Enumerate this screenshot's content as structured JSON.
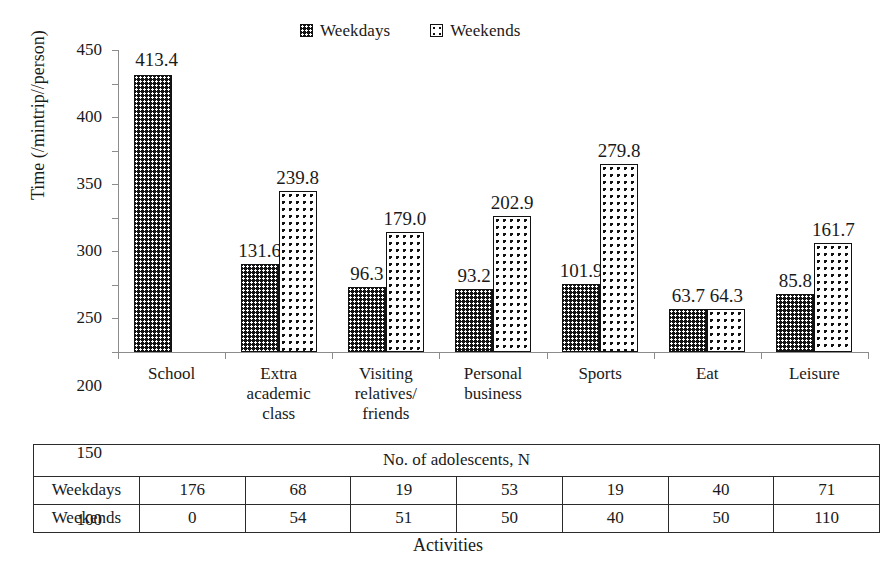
{
  "chart_data": {
    "type": "bar",
    "title": "",
    "xlabel": "Activities",
    "ylabel": "Time (/mintrip//person)",
    "ylim": [
      0,
      450
    ],
    "ytick_step": 50,
    "yticks": [
      450,
      400,
      350,
      300,
      250,
      200,
      150,
      100,
      50,
      0
    ],
    "grid": false,
    "legend_position": "top-center",
    "categories": [
      "School",
      "Extra academic class",
      "Visiting relatives/ friends",
      "Personal business",
      "Sports",
      "Eat",
      "Leisure"
    ],
    "category_lines": [
      [
        "School"
      ],
      [
        "Extra",
        "academic",
        "class"
      ],
      [
        "Visiting",
        "relatives/",
        "friends"
      ],
      [
        "Personal",
        "business"
      ],
      [
        "Sports"
      ],
      [
        "Eat"
      ],
      [
        "Leisure"
      ]
    ],
    "series": [
      {
        "name": "Weekdays",
        "values": [
          413.4,
          131.6,
          96.3,
          93.2,
          101.9,
          63.7,
          85.8
        ],
        "labels": [
          "413.4",
          "131.6",
          "96.3",
          "93.2",
          "101.9",
          "63.7",
          "85.8"
        ],
        "fill": "black-with-white-dots"
      },
      {
        "name": "Weekends",
        "values": [
          null,
          239.8,
          179.0,
          202.9,
          279.8,
          64.3,
          161.7
        ],
        "labels": [
          "",
          "239.8",
          "179.0",
          "202.9",
          "279.8",
          "64.3",
          "161.7"
        ],
        "fill": "white-with-black-dots"
      }
    ]
  },
  "legend": {
    "entries": [
      {
        "label": "Weekdays",
        "swatch": "weekdays-pattern-swatch"
      },
      {
        "label": "Weekends",
        "swatch": "weekends-pattern-swatch"
      }
    ]
  },
  "table": {
    "title": "No. of adolescents, N",
    "rows": [
      {
        "header": "Weekdays",
        "values": [
          "176",
          "68",
          "19",
          "53",
          "19",
          "40",
          "71"
        ]
      },
      {
        "header": "Weekends",
        "values": [
          "0",
          "54",
          "51",
          "50",
          "40",
          "50",
          "110"
        ]
      }
    ]
  },
  "axis": {
    "y_title": "Time (/mintrip//person)",
    "x_title": "Activities"
  },
  "colors": {
    "series_weekdays": "#141414",
    "series_weekends": "#ffffff",
    "outline": "#111111",
    "axis": "#8c8c8c",
    "text": "#1a1a1a"
  }
}
